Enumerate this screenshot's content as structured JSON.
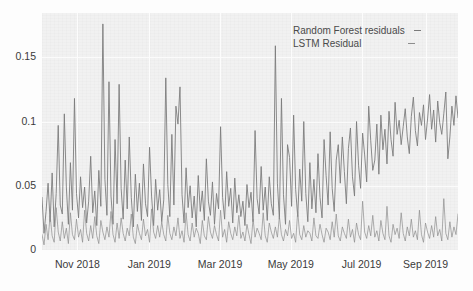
{
  "chart_data": {
    "type": "line",
    "title": "",
    "xlabel": "",
    "ylabel": "",
    "ylim": [
      0,
      0.1845
    ],
    "yticks": [
      "0",
      "0.05",
      "0.1",
      "0.15"
    ],
    "ytick_values": [
      0,
      0.05,
      0.1,
      0.15
    ],
    "xticks": [
      "Nov 2018",
      "Jan 2019",
      "Mar 2019",
      "May 2019",
      "Jul 2019",
      "Sep 2019"
    ],
    "xtick_positions": [
      0.085,
      0.258,
      0.428,
      0.598,
      0.768,
      0.922
    ],
    "grid": true,
    "legend_position": "top-right",
    "colors": {
      "random_forest": "#7a7a7a",
      "lstm": "#8d8d8d",
      "plot_background": "#f1f1f1",
      "gridline": "#fcfcfc",
      "text": "#3a3a3a"
    },
    "series": [
      {
        "name": "Random Forest residuals",
        "marker": "–",
        "color": "#7a7a7a",
        "values": [
          0.041,
          0.013,
          0.03,
          0.052,
          0.022,
          0.06,
          0.018,
          0.044,
          0.097,
          0.035,
          0.028,
          0.106,
          0.049,
          0.02,
          0.068,
          0.031,
          0.118,
          0.044,
          0.025,
          0.057,
          0.033,
          0.049,
          0.021,
          0.038,
          0.073,
          0.029,
          0.046,
          0.019,
          0.062,
          0.034,
          0.176,
          0.055,
          0.027,
          0.131,
          0.042,
          0.02,
          0.086,
          0.036,
          0.129,
          0.048,
          0.024,
          0.07,
          0.032,
          0.088,
          0.041,
          0.018,
          0.059,
          0.03,
          0.052,
          0.023,
          0.067,
          0.036,
          0.026,
          0.08,
          0.042,
          0.019,
          0.055,
          0.031,
          0.047,
          0.022,
          0.039,
          0.134,
          0.051,
          0.026,
          0.09,
          0.035,
          0.112,
          0.098,
          0.127,
          0.043,
          0.021,
          0.064,
          0.033,
          0.05,
          0.025,
          0.042,
          0.018,
          0.058,
          0.03,
          0.046,
          0.023,
          0.071,
          0.038,
          0.027,
          0.053,
          0.02,
          0.044,
          0.032,
          0.096,
          0.041,
          0.024,
          0.061,
          0.034,
          0.048,
          0.021,
          0.056,
          0.029,
          0.043,
          0.026,
          0.038,
          0.019,
          0.051,
          0.033,
          0.045,
          0.022,
          0.093,
          0.04,
          0.028,
          0.065,
          0.031,
          0.049,
          0.023,
          0.057,
          0.036,
          0.027,
          0.159,
          0.052,
          0.024,
          0.118,
          0.043,
          0.02,
          0.082,
          0.072,
          0.034,
          0.105,
          0.047,
          0.026,
          0.063,
          0.038,
          0.1,
          0.044,
          0.022,
          0.068,
          0.032,
          0.055,
          0.029,
          0.075,
          0.041,
          0.025,
          0.086,
          0.058,
          0.035,
          0.092,
          0.048,
          0.03,
          0.07,
          0.082,
          0.052,
          0.088,
          0.061,
          0.036,
          0.079,
          0.095,
          0.057,
          0.042,
          0.1,
          0.066,
          0.048,
          0.091,
          0.074,
          0.053,
          0.112,
          0.085,
          0.062,
          0.07,
          0.098,
          0.059,
          0.105,
          0.078,
          0.094,
          0.067,
          0.108,
          0.086,
          0.073,
          0.115,
          0.09,
          0.101,
          0.082,
          0.096,
          0.11,
          0.088,
          0.075,
          0.104,
          0.119,
          0.093,
          0.081,
          0.107,
          0.097,
          0.113,
          0.086,
          0.102,
          0.121,
          0.094,
          0.109,
          0.084,
          0.116,
          0.099,
          0.09,
          0.106,
          0.123,
          0.071,
          0.088,
          0.112,
          0.097,
          0.12,
          0.103
        ]
      },
      {
        "name": "LSTM Residual",
        "marker": "–",
        "color": "#8d8d8d",
        "values": [
          0.012,
          0.004,
          0.02,
          0.008,
          0.027,
          0.011,
          0.006,
          0.033,
          0.014,
          0.007,
          0.022,
          0.009,
          0.017,
          0.005,
          0.029,
          0.012,
          0.008,
          0.024,
          0.01,
          0.016,
          0.006,
          0.031,
          0.013,
          0.007,
          0.019,
          0.009,
          0.026,
          0.011,
          0.005,
          0.023,
          0.014,
          0.008,
          0.018,
          0.01,
          0.03,
          0.012,
          0.006,
          0.021,
          0.009,
          0.025,
          0.013,
          0.007,
          0.017,
          0.011,
          0.028,
          0.01,
          0.005,
          0.02,
          0.013,
          0.008,
          0.024,
          0.011,
          0.016,
          0.006,
          0.032,
          0.014,
          0.009,
          0.019,
          0.01,
          0.022,
          0.012,
          0.007,
          0.027,
          0.013,
          0.008,
          0.018,
          0.011,
          0.025,
          0.009,
          0.015,
          0.006,
          0.029,
          0.012,
          0.007,
          0.021,
          0.01,
          0.017,
          0.013,
          0.005,
          0.023,
          0.011,
          0.008,
          0.026,
          0.014,
          0.009,
          0.019,
          0.012,
          0.007,
          0.031,
          0.01,
          0.016,
          0.006,
          0.022,
          0.013,
          0.008,
          0.018,
          0.011,
          0.027,
          0.009,
          0.014,
          0.007,
          0.02,
          0.012,
          0.005,
          0.024,
          0.01,
          0.017,
          0.013,
          0.008,
          0.029,
          0.011,
          0.006,
          0.021,
          0.014,
          0.009,
          0.018,
          0.01,
          0.026,
          0.012,
          0.007,
          0.016,
          0.011,
          0.023,
          0.009,
          0.013,
          0.006,
          0.03,
          0.012,
          0.008,
          0.019,
          0.01,
          0.015,
          0.013,
          0.007,
          0.025,
          0.011,
          0.009,
          0.02,
          0.012,
          0.006,
          0.017,
          0.014,
          0.008,
          0.022,
          0.01,
          0.028,
          0.011,
          0.007,
          0.018,
          0.013,
          0.009,
          0.024,
          0.01,
          0.016,
          0.006,
          0.021,
          0.012,
          0.008,
          0.038,
          0.014,
          0.009,
          0.019,
          0.011,
          0.027,
          0.01,
          0.015,
          0.007,
          0.023,
          0.013,
          0.008,
          0.034,
          0.011,
          0.006,
          0.02,
          0.012,
          0.017,
          0.009,
          0.029,
          0.013,
          0.007,
          0.018,
          0.011,
          0.024,
          0.01,
          0.015,
          0.008,
          0.031,
          0.012,
          0.006,
          0.021,
          0.014,
          0.009,
          0.019,
          0.01,
          0.026,
          0.011,
          0.016,
          0.007,
          0.04,
          0.013,
          0.008,
          0.022,
          0.01,
          0.018,
          0.012,
          0.028
        ]
      }
    ]
  }
}
